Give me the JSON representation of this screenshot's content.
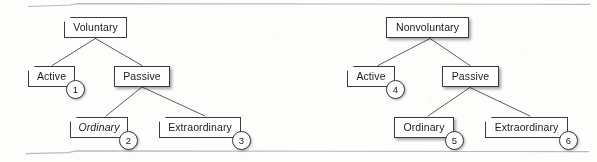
{
  "figure": {
    "rules": {
      "top_rule": "horizontal-rule",
      "bottom_rule": "horizontal-rule"
    }
  },
  "trees": [
    {
      "id": "voluntary-tree",
      "root": {
        "label": "Voluntary"
      },
      "children": [
        {
          "label": "Active",
          "badge": "1",
          "italic": false
        },
        {
          "label": "Passive",
          "children": [
            {
              "label": "Ordinary",
              "badge": "2",
              "italic": true
            },
            {
              "label": "Extraordinary",
              "badge": "3",
              "italic": false
            }
          ]
        }
      ]
    },
    {
      "id": "nonvoluntary-tree",
      "root": {
        "label": "Nonvoluntary"
      },
      "children": [
        {
          "label": "Active",
          "badge": "4",
          "italic": false
        },
        {
          "label": "Passive",
          "children": [
            {
              "label": "Ordinary",
              "badge": "5",
              "italic": false
            },
            {
              "label": "Extraordinary",
              "badge": "6",
              "italic": false
            }
          ]
        }
      ]
    }
  ],
  "nodes": {
    "l_root": {
      "label": "Voluntary"
    },
    "l_act": {
      "label": "Active"
    },
    "l_pas": {
      "label": "Passive"
    },
    "l_ord": {
      "label": "Ordinary"
    },
    "l_ext": {
      "label": "Extraordinary"
    },
    "r_root": {
      "label": "Nonvoluntary"
    },
    "r_act": {
      "label": "Active"
    },
    "r_pas": {
      "label": "Passive"
    },
    "r_ord": {
      "label": "Ordinary"
    },
    "r_ext": {
      "label": "Extraordinary"
    }
  },
  "badges": {
    "b1": "1",
    "b2": "2",
    "b3": "3",
    "b4": "4",
    "b5": "5",
    "b6": "6"
  },
  "colors": {
    "background": "#fdfdfc",
    "box_fill": "#ffffff",
    "box_stroke": "#3a3a3a",
    "connector": "#4a4a4a",
    "rule": "#b9b9b9",
    "text": "#1a1a1a"
  }
}
